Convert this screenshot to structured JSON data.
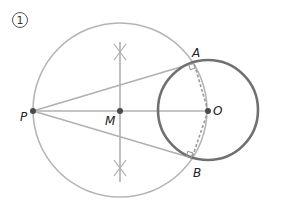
{
  "figure": {
    "step_label": "1",
    "colors": {
      "construction": "#b0b0b0",
      "circle_o": "#6e6e6e",
      "point": "#4a4a4a",
      "dashed": "#9a9a9a",
      "label": "#222222"
    },
    "points": {
      "P": {
        "label": "P",
        "x": 33,
        "y": 111
      },
      "M": {
        "label": "M",
        "x": 120,
        "y": 111
      },
      "O": {
        "label": "O",
        "x": 208,
        "y": 111
      },
      "A": {
        "label": "A",
        "x": 194,
        "y": 63
      },
      "B": {
        "label": "B",
        "x": 192,
        "y": 158
      }
    },
    "circles": {
      "large_circle_center_M": {
        "cx": 120,
        "cy": 110,
        "r": 87
      },
      "circle_O": {
        "cx": 208,
        "cy": 110,
        "r": 50
      }
    },
    "segments": {
      "PO": "P-O",
      "PA": "P-A tangent",
      "PB": "P-B tangent",
      "OA": "O-A dashed radius",
      "OB": "O-B dashed radius",
      "bisector": "perpendicular bisector of PO through M"
    }
  }
}
